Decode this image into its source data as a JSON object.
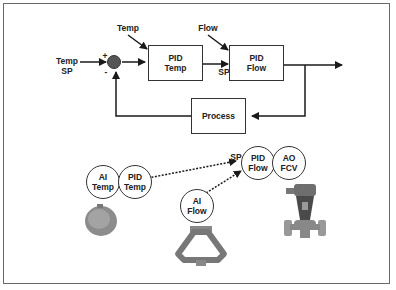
{
  "block_diagram": {
    "inputs": {
      "temp_sp": "Temp\nSP",
      "temp_disturbance": "Temp",
      "flow_disturbance": "Flow",
      "sp_label": "SP"
    },
    "summing_junction": {
      "plus": "+",
      "minus": "-"
    },
    "blocks": {
      "pid_temp": "PID\nTemp",
      "pid_flow": "PID\nFlow",
      "process": "Process"
    }
  },
  "field_diagram": {
    "function_blocks": {
      "ai_temp": "AI\nTemp",
      "pid_temp": "PID\nTemp",
      "ai_flow": "AI\nFlow",
      "pid_flow": "PID\nFlow",
      "ao_fcv": "AO\nFCV"
    },
    "sp_label": "SP",
    "devices": [
      "temperature-transmitter",
      "coriolis-flow-meter",
      "flow-control-valve"
    ]
  },
  "colors": {
    "line": "#1a1a1a",
    "junction": "#555555",
    "border": "#6a6a6a"
  }
}
